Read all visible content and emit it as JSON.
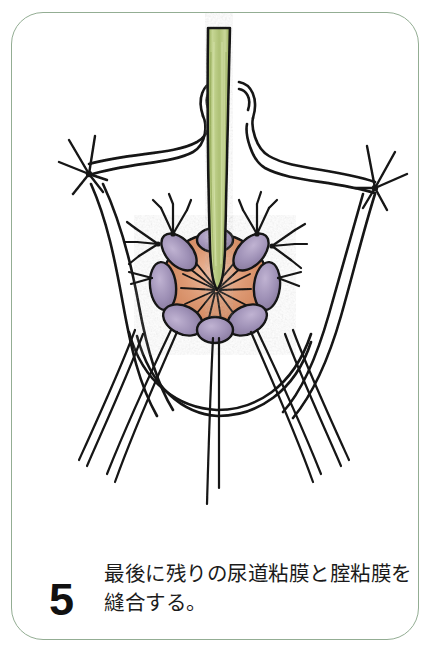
{
  "page": {
    "background_color": "#ffffff",
    "width": 439,
    "height": 654
  },
  "card": {
    "border_color": "#93ad93",
    "corner_radius_px": 32
  },
  "caption": {
    "step_number": "5",
    "text": "最後に残りの尿道粘膜と腟粘膜を縫合する。",
    "line1": "最後に残りの尿道粘膜と腟粘",
    "line2": "膜を縫合する。"
  },
  "illustration": {
    "title": "surgical-suture-diagram",
    "description": "Hand-drawn medical illustration of a vaginal introitus rosette with a green urethral catheter passing through the center, surrounded by purple mucosal flaps and an orange urethral mucosa, with black suture threads.",
    "colors": {
      "catheter_green": "#a6bd6c",
      "catheter_green_light": "#c4d492",
      "catheter_green_dark": "#87a04f",
      "mucosa_orange": "#d4845e",
      "mucosa_orange_light": "#e6ab8b",
      "flap_purple": "#9d8fb5",
      "flap_purple_light": "#b6a9c9",
      "ink_black": "#141414"
    },
    "elements": [
      {
        "name": "urethral-catheter",
        "label": "green catheter tube"
      },
      {
        "name": "urethral-mucosa",
        "label": "orange urethral mucosa"
      },
      {
        "name": "vaginal-mucosa-flaps",
        "label": "purple vaginal mucosa flaps"
      },
      {
        "name": "suture-knot-left",
        "label": "left suture knot"
      },
      {
        "name": "suture-knot-right",
        "label": "right suture knot"
      },
      {
        "name": "suture-threads",
        "label": "long trailing suture threads"
      },
      {
        "name": "labial-outline",
        "label": "perineal tissue outline"
      }
    ]
  }
}
